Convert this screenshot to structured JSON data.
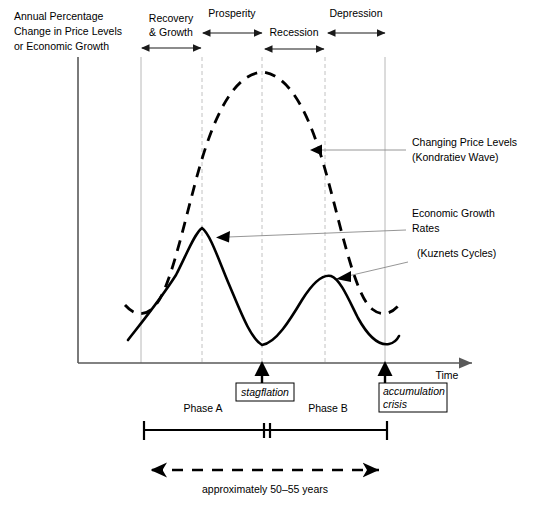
{
  "axes": {
    "y_axis_label_lines": [
      "Annual Percentage",
      "Change in Price Levels",
      "or Economic Growth"
    ],
    "x_axis_label": "Time"
  },
  "phases": [
    {
      "name": "recovery-growth",
      "label_lines": [
        "Recovery",
        "& Growth"
      ],
      "label_x": 171,
      "label_y": 22,
      "arrow_y": 48,
      "x_start": 141,
      "x_end": 202
    },
    {
      "name": "prosperity",
      "label_lines": [
        "Prosperity"
      ],
      "label_x": 232,
      "label_y": 16,
      "arrow_y": 34,
      "x_start": 202,
      "x_end": 262
    },
    {
      "name": "recession",
      "label_lines": [
        "Recession"
      ],
      "label_x": 294,
      "label_y": 34,
      "arrow_y": 48,
      "x_start": 264,
      "x_end": 325
    },
    {
      "name": "depression",
      "label_lines": [
        "Depression"
      ],
      "label_x": 356,
      "label_y": 16,
      "arrow_y": 34,
      "x_start": 327,
      "x_end": 385
    }
  ],
  "gridlines": [
    {
      "x": 141,
      "style": "solid"
    },
    {
      "x": 202,
      "style": "dashed"
    },
    {
      "x": 262,
      "style": "dashed"
    },
    {
      "x": 325,
      "style": "dashed"
    },
    {
      "x": 385,
      "style": "solid"
    }
  ],
  "annotations": [
    {
      "name": "kondratiev-annotation",
      "lines": [
        "Changing Price Levels",
        "(Kondratiev Wave)"
      ],
      "text_x": 412,
      "text_y": 147,
      "arrow_tip_x": 312,
      "arrow_tip_y": 150,
      "leader_from_x": 406,
      "leader_from_y": 150
    },
    {
      "name": "kuznets-rates-annotation",
      "lines": [
        "Economic Growth",
        "Rates"
      ],
      "text_x": 412,
      "text_y": 217,
      "arrow_tip_x": 216,
      "arrow_tip_y": 237,
      "leader_from_x": 406,
      "leader_from_y": 230
    },
    {
      "name": "kuznets-cycles-annotation",
      "lines": [
        "(Kuznets Cycles)"
      ],
      "text_x": 417,
      "text_y": 257,
      "arrow_tip_x": 337,
      "arrow_tip_y": 279,
      "leader_from_x": 408,
      "leader_from_y": 262
    }
  ],
  "events": [
    {
      "name": "stagflation-event",
      "label": "stagflation",
      "x": 262,
      "box_x": 236,
      "box_y": 383,
      "box_w": 58,
      "box_h": 18
    },
    {
      "name": "accumulation-crisis-event",
      "label_lines": [
        "accumulation",
        "crisis"
      ],
      "x": 385,
      "box_x": 379,
      "box_y": 383,
      "box_w": 68,
      "box_h": 28
    }
  ],
  "phase_bar": {
    "x_start": 144,
    "x_end": 387,
    "y": 430,
    "break_x": 267,
    "segments": [
      {
        "name": "phase-a",
        "label": "Phase A",
        "label_x": 203,
        "label_y": 411
      },
      {
        "name": "phase-b",
        "label": "Phase B",
        "label_x": 328,
        "label_y": 411
      }
    ]
  },
  "duration_span": {
    "label": "approximately 50–55 years",
    "label_x": 265,
    "label_y": 492,
    "x_start": 144,
    "x_end": 387,
    "y": 470
  },
  "curves": {
    "price_levels": {
      "name": "kondratiev-wave-curve",
      "style": "dashed",
      "path": "M 125 305 C 133 314, 142 317, 152 309 C 168 296, 180 240, 196 180 C 212 120, 232 75, 262 72 C 292 75, 312 120, 328 180 C 344 240, 356 296, 372 309 C 382 317, 391 314, 399 305"
    },
    "growth_rates": {
      "name": "kuznets-cycles-curve",
      "style": "solid",
      "path": "M 128 340 C 142 322, 160 300, 176 275 C 186 256, 194 234, 202 228 C 210 234, 218 258, 228 282 C 240 310, 250 338, 262 345 C 276 343, 290 320, 302 300 C 312 284, 322 274, 331 276 C 340 279, 348 298, 358 318 C 368 336, 378 346, 389 344 C 394 343, 397 340, 399 336"
    }
  }
}
